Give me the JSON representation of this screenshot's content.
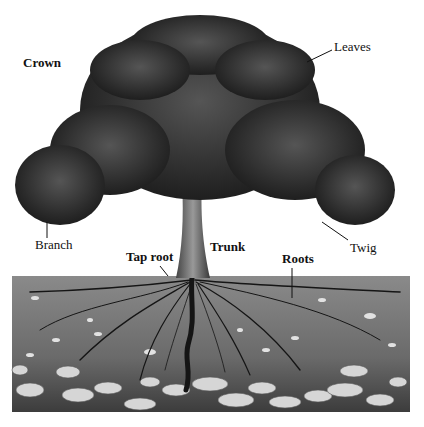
{
  "diagram": {
    "labels": {
      "crown": "Crown",
      "leaves": "Leaves",
      "branch": "Branch",
      "twig": "Twig",
      "tap_root": "Tap root",
      "trunk": "Trunk",
      "roots": "Roots"
    },
    "colors": {
      "background": "#ffffff",
      "foliage": "#2a2a2a",
      "soil": "#6e6e6e",
      "stones": "#d8d8d8",
      "ink": "#111111"
    }
  }
}
